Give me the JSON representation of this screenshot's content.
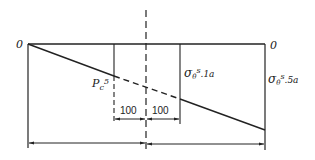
{
  "diagram": {
    "type": "stress distribution diagram",
    "colors": {
      "line": "#222222",
      "background": "#ffffff"
    },
    "labels": {
      "zero_left": "0",
      "zero_right": "0",
      "pc": "P",
      "pc_sub": "c",
      "pc_sup": "5",
      "sigma_1a_base": "σ",
      "sigma_1a_sub": "θ",
      "sigma_1a_sup": "s",
      "sigma_1a_idx": ".1a",
      "sigma_5a_base": "σ",
      "sigma_5a_sub": "θ",
      "sigma_5a_sup": "s",
      "sigma_5a_idx": ".5a"
    },
    "dimensions": {
      "left_offset": "100",
      "right_offset": "100"
    }
  }
}
